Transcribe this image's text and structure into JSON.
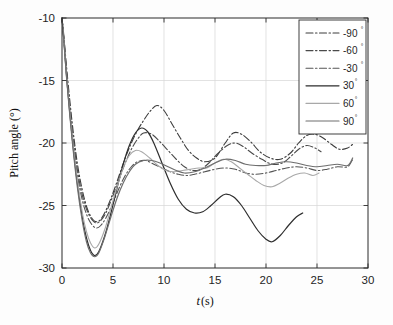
{
  "chart_data": {
    "type": "line",
    "title": "",
    "xlabel": "t (s)",
    "ylabel": "Pitch angle (°)",
    "xlim": [
      0,
      30
    ],
    "ylim": [
      -30,
      -10
    ],
    "xticks": [
      0,
      5,
      10,
      15,
      20,
      25,
      30
    ],
    "yticks": [
      -30,
      -25,
      -20,
      -15,
      -10
    ],
    "xtick_labels": [
      "0",
      "5",
      "10",
      "15",
      "20",
      "25",
      "30"
    ],
    "ytick_labels": [
      "-30",
      "-25",
      "-20",
      "-15",
      "-10"
    ],
    "grid": true,
    "legend_position": "top-right",
    "legend_entries": [
      "-90°",
      "-60°",
      "-30°",
      "30°",
      "60°",
      "90°"
    ],
    "series": [
      {
        "name": "-90°",
        "label_value": "-90",
        "label_unit": "°",
        "style": "dashdot",
        "color": "#3c3c3c",
        "width": 1.1,
        "x": [
          0,
          0.2,
          0.5,
          1.0,
          1.5,
          2.0,
          2.5,
          3.0,
          3.4,
          3.8,
          4.3,
          5.0,
          5.6,
          6.2,
          6.8,
          7.4,
          8.0,
          8.6,
          9.3,
          10.0,
          10.8,
          11.6,
          12.4,
          13.2,
          14.0,
          15.0,
          16.0,
          16.8,
          17.6,
          18.5,
          19.4,
          20.4,
          21.4,
          22.4,
          23.2,
          24.0,
          24.8,
          25.6,
          26.4,
          27.2,
          28.0,
          28.5
        ],
        "y": [
          -10.0,
          -11.6,
          -14.4,
          -18.4,
          -21.6,
          -23.8,
          -25.3,
          -26.1,
          -26.3,
          -26.1,
          -25.4,
          -24.0,
          -22.6,
          -21.2,
          -20.0,
          -19.0,
          -18.2,
          -17.5,
          -17.0,
          -17.4,
          -18.5,
          -19.6,
          -20.6,
          -21.2,
          -21.5,
          -21.2,
          -20.0,
          -19.2,
          -19.3,
          -19.9,
          -20.7,
          -21.2,
          -21.3,
          -20.8,
          -20.0,
          -19.4,
          -19.3,
          -19.6,
          -20.1,
          -20.5,
          -20.4,
          -20.1
        ]
      },
      {
        "name": "-60°",
        "label_value": "-60",
        "label_unit": "°",
        "style": "dashdot",
        "color": "#4a4a4a",
        "width": 1.1,
        "x": [
          0,
          0.2,
          0.5,
          1.0,
          1.5,
          2.0,
          2.5,
          3.0,
          3.4,
          3.8,
          4.3,
          5.0,
          5.6,
          6.2,
          6.8,
          7.4,
          8.0,
          8.8,
          9.6,
          10.4,
          11.2,
          12.0,
          12.8,
          13.6,
          14.4,
          15.2,
          16.2,
          17.0,
          17.8,
          18.6,
          19.6,
          20.6,
          21.6,
          22.4,
          23.2,
          24.0,
          24.8,
          25.4
        ],
        "y": [
          -10.0,
          -11.8,
          -14.8,
          -18.9,
          -22.1,
          -24.2,
          -25.5,
          -26.2,
          -26.4,
          -26.2,
          -25.6,
          -24.2,
          -22.9,
          -21.6,
          -20.5,
          -19.7,
          -19.2,
          -19.3,
          -19.9,
          -20.6,
          -21.3,
          -21.9,
          -22.2,
          -22.1,
          -21.6,
          -20.9,
          -20.2,
          -20.0,
          -20.3,
          -20.8,
          -21.3,
          -21.7,
          -21.6,
          -21.1,
          -20.5,
          -20.2,
          -20.4,
          -20.7
        ]
      },
      {
        "name": "-30°",
        "label_value": "-30",
        "label_unit": "°",
        "style": "dashdot",
        "color": "#555555",
        "width": 1.1,
        "x": [
          0,
          0.2,
          0.5,
          1.0,
          1.5,
          2.0,
          2.5,
          3.0,
          3.4,
          3.8,
          4.3,
          5.0,
          5.6,
          6.2,
          6.8,
          7.4,
          8.2,
          9.0,
          9.8,
          10.6,
          11.4,
          12.2,
          13.0,
          14.0,
          15.0,
          16.0,
          17.0,
          18.0,
          19.0,
          20.0,
          21.0,
          22.0,
          23.0,
          24.0,
          25.0,
          26.0,
          27.0,
          28.0,
          28.5
        ],
        "y": [
          -10.0,
          -11.9,
          -15.0,
          -19.2,
          -22.5,
          -24.6,
          -25.9,
          -26.6,
          -26.8,
          -26.6,
          -26.0,
          -24.8,
          -23.6,
          -22.6,
          -21.9,
          -21.5,
          -21.4,
          -21.7,
          -22.0,
          -22.3,
          -22.5,
          -22.6,
          -22.5,
          -22.3,
          -22.1,
          -22.0,
          -22.1,
          -22.4,
          -22.5,
          -22.4,
          -22.2,
          -22.0,
          -21.9,
          -22.0,
          -22.2,
          -22.1,
          -21.9,
          -21.9,
          -21.3
        ]
      },
      {
        "name": "30°",
        "label_value": "30",
        "label_unit": "°",
        "style": "solid",
        "color": "#2e2e2e",
        "width": 1.2,
        "x": [
          0,
          0.2,
          0.5,
          1.0,
          1.5,
          2.0,
          2.4,
          2.8,
          3.2,
          3.6,
          4.2,
          4.8,
          5.4,
          6.0,
          6.6,
          7.2,
          7.8,
          8.4,
          9.0,
          9.8,
          10.6,
          11.4,
          12.2,
          13.0,
          13.8,
          14.6,
          15.4,
          16.0,
          16.8,
          17.6,
          18.4,
          19.2,
          20.0,
          20.6,
          21.4,
          22.2,
          23.0,
          23.6
        ],
        "y": [
          -10.0,
          -12.0,
          -15.2,
          -19.6,
          -23.2,
          -26.0,
          -27.6,
          -28.6,
          -29.0,
          -28.7,
          -27.4,
          -25.6,
          -23.6,
          -21.7,
          -20.2,
          -19.2,
          -18.8,
          -19.1,
          -20.0,
          -21.6,
          -23.2,
          -24.5,
          -25.3,
          -25.6,
          -25.5,
          -25.0,
          -24.4,
          -24.1,
          -24.3,
          -25.0,
          -26.0,
          -27.0,
          -27.7,
          -27.9,
          -27.4,
          -26.6,
          -25.9,
          -25.6
        ]
      },
      {
        "name": "60°",
        "label_value": "60",
        "label_unit": "°",
        "style": "solid",
        "color": "#a8a8a8",
        "width": 1.1,
        "x": [
          0,
          0.2,
          0.5,
          1.0,
          1.5,
          2.0,
          2.4,
          2.8,
          3.2,
          3.6,
          4.2,
          4.8,
          5.4,
          6.0,
          6.6,
          7.2,
          7.8,
          8.6,
          9.4,
          10.2,
          11.0,
          11.8,
          12.6,
          13.4,
          14.2,
          15.0,
          15.8,
          16.6,
          17.4,
          18.2,
          19.0,
          19.8,
          20.6,
          21.4,
          22.2,
          23.0,
          23.8,
          24.6,
          25.2
        ],
        "y": [
          -10.0,
          -11.9,
          -15.1,
          -19.4,
          -22.9,
          -25.6,
          -27.1,
          -28.0,
          -28.4,
          -28.1,
          -26.9,
          -25.2,
          -23.5,
          -22.0,
          -21.0,
          -20.6,
          -20.7,
          -21.2,
          -21.8,
          -22.2,
          -22.3,
          -22.2,
          -22.1,
          -22.0,
          -22.0,
          -21.6,
          -21.3,
          -21.5,
          -22.0,
          -22.5,
          -23.0,
          -23.4,
          -23.5,
          -23.2,
          -22.8,
          -22.5,
          -22.4,
          -22.6,
          -22.4
        ]
      },
      {
        "name": "90°",
        "label_value": "90",
        "label_unit": "°",
        "style": "solid",
        "color": "#6e6e6e",
        "width": 1.2,
        "x": [
          0,
          0.2,
          0.5,
          1.0,
          1.5,
          2.0,
          2.4,
          2.8,
          3.2,
          3.6,
          4.2,
          4.8,
          5.4,
          6.0,
          6.6,
          7.2,
          8.0,
          8.8,
          9.6,
          10.4,
          11.2,
          12.0,
          13.0,
          14.0,
          15.0,
          16.0,
          17.0,
          18.0,
          19.0,
          20.0,
          21.0,
          22.0,
          23.0,
          24.0,
          25.0,
          26.0,
          27.0,
          28.0,
          28.5
        ],
        "y": [
          -10.0,
          -12.0,
          -15.3,
          -19.8,
          -23.5,
          -26.3,
          -27.9,
          -28.8,
          -29.1,
          -28.8,
          -27.5,
          -25.9,
          -24.4,
          -23.2,
          -22.3,
          -21.7,
          -21.4,
          -21.4,
          -21.6,
          -21.9,
          -22.2,
          -22.4,
          -22.3,
          -22.0,
          -21.6,
          -21.3,
          -21.4,
          -21.7,
          -21.8,
          -21.8,
          -21.6,
          -21.5,
          -21.6,
          -21.8,
          -21.9,
          -21.8,
          -21.7,
          -21.8,
          -21.2
        ]
      }
    ]
  },
  "axes": {
    "xlabel_italic": "t",
    "xlabel_rest": " (s)",
    "ylabel_text": "Pitch angle (",
    "ylabel_symbol": "°",
    "ylabel_close": ")"
  },
  "legend": {
    "items": [
      {
        "label": "-90",
        "unit": "°"
      },
      {
        "label": "-60",
        "unit": "°"
      },
      {
        "label": "-30",
        "unit": "°"
      },
      {
        "label": "30",
        "unit": "°"
      },
      {
        "label": "60",
        "unit": "°"
      },
      {
        "label": "90",
        "unit": "°"
      }
    ]
  },
  "colors": {
    "axis": "#2b2b2b",
    "grid": "#d6d6d6",
    "background": "#fdfdfd"
  }
}
